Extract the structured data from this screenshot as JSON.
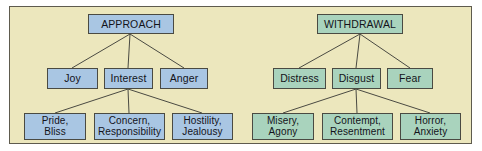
{
  "diagram": {
    "type": "hierarchy-tree",
    "background_color": "#ece7bd",
    "border_color": "#5e5b4e",
    "branches": [
      {
        "id": "approach",
        "root": "APPROACH",
        "box_color": "#a9c6e3",
        "level2": [
          {
            "label": "Joy"
          },
          {
            "label": "Interest"
          },
          {
            "label": "Anger"
          }
        ],
        "level3": [
          {
            "line1": "Pride,",
            "line2": "Bliss"
          },
          {
            "line1": "Concern,",
            "line2": "Responsibility"
          },
          {
            "line1": "Hostility,",
            "line2": "Jealousy"
          }
        ]
      },
      {
        "id": "withdrawal",
        "root": "WITHDRAWAL",
        "box_color": "#a9d3bd",
        "level2": [
          {
            "label": "Distress"
          },
          {
            "label": "Disgust"
          },
          {
            "label": "Fear"
          }
        ],
        "level3": [
          {
            "line1": "Misery,",
            "line2": "Agony"
          },
          {
            "line1": "Contempt,",
            "line2": "Resentment"
          },
          {
            "line1": "Horror,",
            "line2": "Anxiety"
          }
        ]
      }
    ]
  }
}
